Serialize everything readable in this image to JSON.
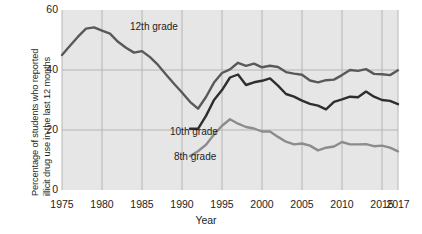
{
  "chart_data": {
    "type": "line",
    "title": "",
    "xlabel": "Year",
    "ylabel": "Percentage of students who reported illicit drug use in the last 12 months",
    "ylabel_line1": "Percentage of students who reported",
    "ylabel_line2": "illicit drug use in the last 12 months",
    "xlim": [
      1975,
      2017
    ],
    "ylim": [
      0,
      60
    ],
    "yticks": [
      0,
      20,
      40,
      60
    ],
    "xticks": [
      1975,
      1980,
      1985,
      1990,
      1995,
      2000,
      2005,
      2010,
      2015,
      2017
    ],
    "grid": true,
    "legend_position": "inline-annotations",
    "plot_background": "#e6e6e6",
    "grid_color": "#b0b0b0",
    "series": [
      {
        "name": "12th grade",
        "color": "#595959",
        "label_x": 1983.5,
        "label_y": 54.5,
        "x": [
          1975,
          1976,
          1977,
          1978,
          1979,
          1980,
          1981,
          1982,
          1983,
          1984,
          1985,
          1986,
          1987,
          1988,
          1989,
          1990,
          1991,
          1992,
          1993,
          1994,
          1995,
          1996,
          1997,
          1998,
          1999,
          2000,
          2001,
          2002,
          2003,
          2004,
          2005,
          2006,
          2007,
          2008,
          2009,
          2010,
          2011,
          2012,
          2013,
          2014,
          2015,
          2016,
          2017
        ],
        "y": [
          45.0,
          48.1,
          51.1,
          53.8,
          54.2,
          53.1,
          52.1,
          49.4,
          47.4,
          45.8,
          46.3,
          44.3,
          41.7,
          38.5,
          35.4,
          32.5,
          29.4,
          27.1,
          31.0,
          35.8,
          39.0,
          40.2,
          42.4,
          41.4,
          42.1,
          40.9,
          41.4,
          41.0,
          39.3,
          38.8,
          38.4,
          36.5,
          35.9,
          36.6,
          36.8,
          38.3,
          40.0,
          39.7,
          40.3,
          38.7,
          38.6,
          38.3,
          39.9
        ]
      },
      {
        "name": "10th grade",
        "color": "#2e2e2e",
        "label_x": 1988.5,
        "label_y": 19.5,
        "x": [
          1991,
          1992,
          1993,
          1994,
          1995,
          1996,
          1997,
          1998,
          1999,
          2000,
          2001,
          2002,
          2003,
          2004,
          2005,
          2006,
          2007,
          2008,
          2009,
          2010,
          2011,
          2012,
          2013,
          2014,
          2015,
          2016,
          2017
        ],
        "y": [
          20.4,
          20.4,
          24.7,
          30.0,
          33.3,
          37.5,
          38.5,
          35.0,
          35.9,
          36.4,
          37.2,
          34.8,
          32.0,
          31.1,
          29.8,
          28.7,
          28.1,
          26.9,
          29.4,
          30.2,
          31.1,
          30.9,
          32.8,
          31.1,
          30.0,
          29.7,
          28.6
        ]
      },
      {
        "name": "8th grade",
        "color": "#8c8c8c",
        "label_x": 1989.0,
        "label_y": 11.0,
        "x": [
          1991,
          1992,
          1993,
          1994,
          1995,
          1996,
          1997,
          1998,
          1999,
          2000,
          2001,
          2002,
          2003,
          2004,
          2005,
          2006,
          2007,
          2008,
          2009,
          2010,
          2011,
          2012,
          2013,
          2014,
          2015,
          2016,
          2017
        ],
        "y": [
          11.3,
          12.9,
          15.1,
          18.5,
          21.4,
          23.6,
          22.1,
          21.0,
          20.5,
          19.5,
          19.5,
          17.7,
          16.1,
          15.2,
          15.5,
          14.8,
          13.2,
          14.1,
          14.5,
          16.0,
          15.2,
          15.2,
          15.3,
          14.6,
          14.8,
          14.1,
          12.9
        ]
      }
    ]
  }
}
